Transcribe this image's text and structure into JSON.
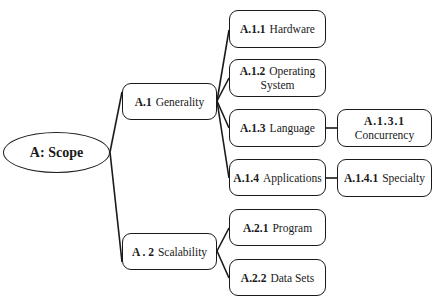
{
  "diagram": {
    "type": "tree",
    "root": {
      "id": "A",
      "label": "A:  Scope"
    },
    "nodes": [
      {
        "id": "A.1",
        "code": "A.1",
        "label": "Generality",
        "parent": "A"
      },
      {
        "id": "A.2",
        "code": "A . 2",
        "label": "Scalability",
        "parent": "A"
      },
      {
        "id": "A.1.1",
        "code": "A.1.1",
        "label": "Hardware",
        "parent": "A.1"
      },
      {
        "id": "A.1.2",
        "code": "A.1.2",
        "label": "Operating",
        "label2": "System",
        "parent": "A.1"
      },
      {
        "id": "A.1.3",
        "code": "A.1.3",
        "label": "Language",
        "parent": "A.1"
      },
      {
        "id": "A.1.4",
        "code": "A.1.4",
        "label": "Applications",
        "parent": "A.1"
      },
      {
        "id": "A.1.3.1",
        "code": "A.1.3.1",
        "label": "Concurrency",
        "parent": "A.1.3"
      },
      {
        "id": "A.1.4.1",
        "code": "A.1.4.1",
        "label": "Specialty",
        "parent": "A.1.4"
      },
      {
        "id": "A.2.1",
        "code": "A.2.1",
        "label": "Program",
        "parent": "A.2"
      },
      {
        "id": "A.2.2",
        "code": "A.2.2",
        "label": "Data Sets",
        "parent": "A.2"
      }
    ],
    "colors": {
      "stroke": "#1a1a1a",
      "fill": "#ffffff",
      "text": "#1a1a1a"
    }
  }
}
